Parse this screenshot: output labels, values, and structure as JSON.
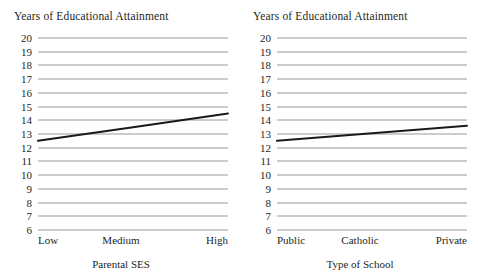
{
  "figure": {
    "background_color": "#ffffff",
    "gridline_color": "#9a9a9a",
    "series_color": "#1a1a1a"
  },
  "chart_data": [
    {
      "type": "line",
      "panel": "left",
      "title": "Years of Educational Attainment",
      "xlabel": "Parental SES",
      "ylabel": "Years of Educational Attainment",
      "categories": [
        "Low",
        "Medium",
        "High"
      ],
      "x": [
        0,
        1,
        2
      ],
      "values": [
        12.5,
        13.5,
        14.5
      ],
      "series": [
        {
          "name": "Years of Educational Attainment",
          "values": [
            12.5,
            13.5,
            14.5
          ]
        }
      ],
      "ylim": [
        6,
        20
      ],
      "yticks": [
        20,
        19,
        18,
        17,
        16,
        15,
        14,
        13,
        12,
        11,
        10,
        9,
        8,
        7,
        6
      ],
      "grid": true,
      "legend": "none"
    },
    {
      "type": "line",
      "panel": "right",
      "title": "Years of Educational Attainment",
      "xlabel": "Type of School",
      "ylabel": "Years of Educational Attainment",
      "categories": [
        "Public",
        "Catholic",
        "Private"
      ],
      "x": [
        0,
        1,
        2
      ],
      "values": [
        12.5,
        13.05,
        13.6
      ],
      "series": [
        {
          "name": "Years of Educational Attainment",
          "values": [
            12.5,
            13.05,
            13.6
          ]
        }
      ],
      "ylim": [
        6,
        20
      ],
      "yticks": [
        20,
        19,
        18,
        17,
        16,
        15,
        14,
        13,
        12,
        11,
        10,
        9,
        8,
        7,
        6
      ],
      "grid": true,
      "legend": "none"
    }
  ],
  "left_panel": {
    "title": "Years of Educational Attainment",
    "axis_label": "Parental SES",
    "xticks": {
      "start": "Low",
      "mid": "Medium",
      "end": "High"
    }
  },
  "right_panel": {
    "title": "Years of Educational Attainment",
    "axis_label": "Type of School",
    "xticks": {
      "start": "Public",
      "mid": "Catholic",
      "end": "Private"
    }
  }
}
